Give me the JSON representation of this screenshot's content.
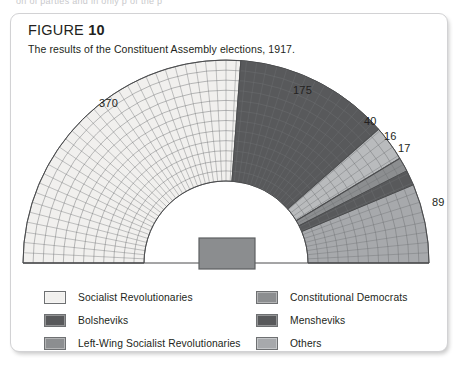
{
  "page": {
    "cutoff_text": "on   of  parties   and   in   only    p     of   the      p"
  },
  "figure": {
    "label": "FIGURE",
    "number": "10",
    "caption": "The results of the Constituent Assembly elections, 1917."
  },
  "colors": {
    "socialist_revolutionaries": "#f1f0ee",
    "bolsheviks": "#58595b",
    "left_wing_sr": "#b9bbbd",
    "constitutional_democrats": "#8c8e90",
    "mensheviks": "#58595b",
    "others": "#a7a9ac",
    "outline": "#6e7072",
    "podium": "#8b8d8f",
    "panel_border": "#d2d2d4",
    "text": "#231f20"
  },
  "legend": {
    "items": [
      {
        "label": "Socialist Revolutionaries",
        "color": "#f1f0ee",
        "column": "left"
      },
      {
        "label": "Bolsheviks",
        "color": "#58595b",
        "column": "left"
      },
      {
        "label": "Left-Wing Socialist Revolutionaries",
        "color": "#8c8e90",
        "column": "left"
      },
      {
        "label": "Constitutional Democrats",
        "color": "#8c8e90",
        "column": "right"
      },
      {
        "label": "Mensheviks",
        "color": "#58595b",
        "column": "right"
      },
      {
        "label": "Others",
        "color": "#a7a9ac",
        "column": "right"
      }
    ]
  },
  "chart_data": {
    "type": "pie",
    "variant": "hemicycle-parliament-diagram",
    "title": "The results of the Constituent Assembly elections, 1917.",
    "unit": "seats",
    "total": 707,
    "categories": [
      "Socialist Revolutionaries",
      "Bolsheviks",
      "Left-Wing Socialist Revolutionaries",
      "Constitutional Democrats",
      "Mensheviks",
      "Others"
    ],
    "values": [
      370,
      175,
      40,
      16,
      17,
      89
    ],
    "colors": [
      "#f1f0ee",
      "#58595b",
      "#b9bbbd",
      "#8c8e90",
      "#58595b",
      "#a7a9ac"
    ],
    "labels_shown": [
      "370",
      "175",
      "40",
      "16",
      "17",
      "89"
    ],
    "legend_position": "bottom",
    "grid": false,
    "xlabel": "",
    "ylabel": "",
    "seat_rows": 12,
    "order_left_to_right": [
      "Socialist Revolutionaries",
      "Bolsheviks",
      "Left-Wing Socialist Revolutionaries",
      "Constitutional Democrats",
      "Mensheviks",
      "Others"
    ],
    "value_labels": [
      {
        "text": "370",
        "x": 88,
        "y": 83
      },
      {
        "text": "175",
        "x": 282,
        "y": 70
      },
      {
        "text": "40",
        "x": 353,
        "y": 101
      },
      {
        "text": "16",
        "x": 373,
        "y": 116
      },
      {
        "text": "17",
        "x": 387,
        "y": 128
      },
      {
        "text": "89",
        "x": 421,
        "y": 182
      }
    ]
  }
}
